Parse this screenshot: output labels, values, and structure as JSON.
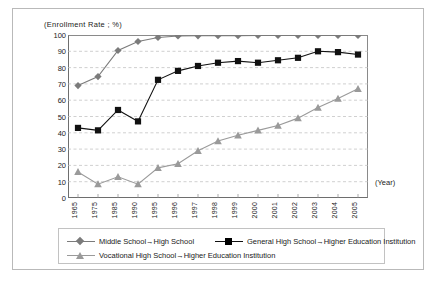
{
  "chart_data": {
    "type": "line",
    "title": "(Enrollment Rate ; %)",
    "xlabel": "(Year)",
    "ylabel": "",
    "ylim": [
      0,
      100
    ],
    "ytick_step": 10,
    "grid": true,
    "grid_style": "dashed-horizontal",
    "legend_position": "bottom",
    "categories": [
      "1965",
      "1975",
      "1985",
      "1990",
      "1995",
      "1996",
      "1997",
      "1998",
      "1999",
      "2000",
      "2001",
      "2002",
      "2003",
      "2004",
      "2005"
    ],
    "yticks": [
      "100",
      "90",
      "80",
      "70",
      "60",
      "50",
      "40",
      "30",
      "20",
      "10",
      "0"
    ],
    "series": [
      {
        "name": "Middle School→High School",
        "marker": "diamond",
        "color": "#7b7b7b",
        "values": [
          69.0,
          74.5,
          90.5,
          96.0,
          98.5,
          99.4,
          99.5,
          99.6,
          99.6,
          99.7,
          99.7,
          99.7,
          99.7,
          99.7,
          99.7
        ]
      },
      {
        "name": "General High School→Higher Education Institution",
        "marker": "square",
        "color": "#111111",
        "values": [
          43.0,
          41.5,
          54.0,
          47.0,
          72.5,
          78.0,
          81.0,
          83.0,
          84.0,
          83.0,
          84.5,
          86.0,
          90.0,
          89.5,
          88.0
        ]
      },
      {
        "name": "Vocational High School→Higher Education Institution",
        "marker": "triangle",
        "color": "#9a9a9a",
        "values": [
          16.0,
          8.5,
          13.0,
          8.5,
          18.5,
          21.0,
          29.0,
          35.0,
          38.5,
          41.5,
          44.5,
          49.0,
          55.5,
          61.0,
          67.0
        ]
      }
    ]
  }
}
